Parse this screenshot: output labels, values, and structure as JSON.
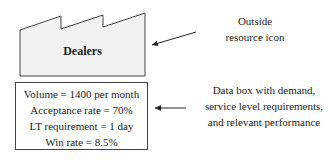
{
  "outside_resource": {
    "label": "Dealers",
    "icon": "factory-icon"
  },
  "data_box": {
    "lines": [
      "Volume = 1400 per month",
      "Acceptance rate = 70%",
      "LT requirement = 1 day",
      "Win rate = 8.5%"
    ]
  },
  "annotations": {
    "outside_resource": {
      "line1": "Outside",
      "line2": "resource icon"
    },
    "data_box": {
      "line1": "Data box with demand,",
      "line2": "service level requirements,",
      "line3": "and relevant performance"
    }
  },
  "colors": {
    "stroke": "#444444",
    "fill": "#f2f2f2"
  }
}
